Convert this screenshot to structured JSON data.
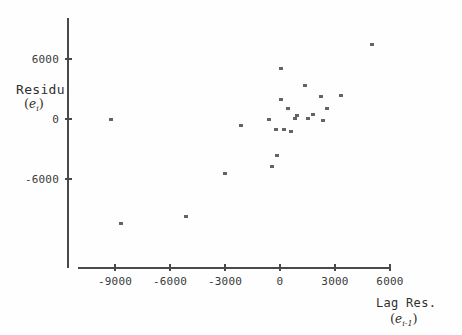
{
  "chart_data": {
    "type": "scatter",
    "title": "",
    "xlabel": "Lag Res. (e i-1)",
    "ylabel": "Residu (e i)",
    "xlim": [
      -11000,
      6800
    ],
    "ylim": [
      -9800,
      8200
    ],
    "grid": false,
    "legend": null,
    "x_ticks": [
      -9000,
      -6000,
      -3000,
      0,
      3000,
      6000
    ],
    "y_ticks": [
      6000,
      0,
      -6000
    ],
    "x_tick_labels": [
      "-9000",
      "-6000",
      "-3000",
      "0",
      "3000",
      "6000"
    ],
    "y_tick_labels": [
      "6000",
      "0",
      "-6000"
    ],
    "marker": "small-square",
    "marker_color": "#646464",
    "points": [
      {
        "x": -9200,
        "y": 0
      },
      {
        "x": -8650,
        "y": -10500
      },
      {
        "x": -5150,
        "y": -9750
      },
      {
        "x": -2150,
        "y": -700
      },
      {
        "x": -3000,
        "y": -5500
      },
      {
        "x": -600,
        "y": 0
      },
      {
        "x": -230,
        "y": -1100
      },
      {
        "x": 230,
        "y": -1100
      },
      {
        "x": 600,
        "y": -1300
      },
      {
        "x": 50,
        "y": 5050
      },
      {
        "x": 1350,
        "y": 3350
      },
      {
        "x": 50,
        "y": 2000
      },
      {
        "x": 3350,
        "y": 2400
      },
      {
        "x": 450,
        "y": 1050
      },
      {
        "x": 2250,
        "y": 2300
      },
      {
        "x": 800,
        "y": 50
      },
      {
        "x": 1550,
        "y": 50
      },
      {
        "x": 2550,
        "y": 1050
      },
      {
        "x": 2350,
        "y": -150
      },
      {
        "x": 5000,
        "y": 7450
      },
      {
        "x": 1800,
        "y": 500
      },
      {
        "x": -180,
        "y": -3700
      },
      {
        "x": -420,
        "y": -4800
      },
      {
        "x": 900,
        "y": 350
      }
    ]
  },
  "axes": {
    "y_title_main": "Residu",
    "y_title_var": "e",
    "y_title_sub": "i",
    "x_title_main": "Lag Res.",
    "x_title_var": "e",
    "x_title_sub": "i-1"
  },
  "colors": {
    "axis": "#4a4a4a",
    "marker": "#646464",
    "text": "#2e2e2e",
    "background": "#fefefe"
  }
}
